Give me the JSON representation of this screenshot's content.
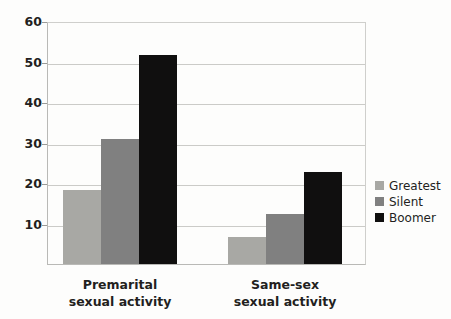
{
  "chart_data": {
    "type": "bar",
    "title": "",
    "subtitle": "",
    "xlabel": "",
    "ylabel": "",
    "categories": [
      "Premarital\nsexual activity",
      "Same-sex\nsexual activity"
    ],
    "series": [
      {
        "name": "Greatest",
        "color": "#a8a8a4",
        "values": [
          18.5,
          6.7
        ]
      },
      {
        "name": "Silent",
        "color": "#808080",
        "values": [
          31,
          12.5
        ]
      },
      {
        "name": "Boomer",
        "color": "#100f0f",
        "values": [
          52,
          23
        ]
      }
    ],
    "ylim": [
      0,
      60
    ],
    "yticks": [
      10,
      20,
      30,
      40,
      50,
      60
    ],
    "ytick_labels": [
      "10",
      "20",
      "30",
      "40",
      "50",
      "60"
    ],
    "grid": "horizontal",
    "legend_position": "right"
  },
  "legend": {
    "items": [
      {
        "label": "Greatest"
      },
      {
        "label": "Silent"
      },
      {
        "label": "Boomer"
      }
    ]
  },
  "axes": {
    "y_labels": [
      "60",
      "50",
      "40",
      "30",
      "20",
      "10"
    ]
  },
  "categories": [
    {
      "line1": "Premarital",
      "line2": "sexual activity"
    },
    {
      "line1": "Same-sex",
      "line2": "sexual activity"
    }
  ]
}
